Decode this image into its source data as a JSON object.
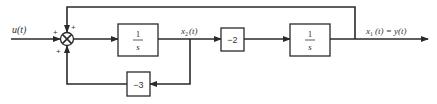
{
  "diagram": {
    "type": "block-diagram",
    "input": {
      "label": "u(t)"
    },
    "summing_junction": {
      "signs": {
        "left": "+",
        "top": "+",
        "bottom": "+"
      }
    },
    "blocks": [
      {
        "id": "integrator-1",
        "numerator": "1",
        "denominator": "s"
      },
      {
        "id": "gain-2",
        "label": "−2"
      },
      {
        "id": "integrator-2",
        "numerator": "1",
        "denominator": "s"
      },
      {
        "id": "gain-3",
        "label": "−3"
      }
    ],
    "signals": {
      "x2": {
        "base": "x",
        "sub": "2",
        "arg": "(t)"
      },
      "output": {
        "base": "x",
        "sub": "1",
        "arg": "(t) = y(t)"
      }
    },
    "connections": [
      "u(t) -> summing_junction (+)",
      "summing_junction -> integrator-1",
      "integrator-1 -> x2(t)",
      "x2(t) -> gain-2",
      "gain-2 -> integrator-2",
      "integrator-2 -> x1(t) = y(t)",
      "x1(t) -> summing_junction (+, top feedback)",
      "x2(t) -> gain-3 -> summing_junction (+, bottom feedback)"
    ],
    "colors": {
      "line": "#2a2a2a",
      "background": "#ffffff"
    }
  }
}
